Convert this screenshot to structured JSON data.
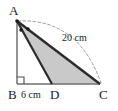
{
  "figure": {
    "type": "geometry-diagram",
    "width": 118,
    "height": 111,
    "colors": {
      "background": "#ffffff",
      "stroke": "#2b2b2b",
      "shade_fill": "#c9c9c9",
      "thin_stroke": "#6e6e6e",
      "dash_stroke": "#8c8c8c",
      "label_color": "#1a1a1a"
    },
    "vertices": [
      {
        "name": "A",
        "label": "A",
        "x": 17,
        "y": 21
      },
      {
        "name": "B",
        "label": "B",
        "x": 17,
        "y": 84
      },
      {
        "name": "D",
        "label": "D",
        "x": 52,
        "y": 84
      },
      {
        "name": "C",
        "label": "C",
        "x": 100,
        "y": 84
      }
    ],
    "segments": [
      {
        "name": "AB",
        "from": "A",
        "to": "B",
        "style": "solid-thin"
      },
      {
        "name": "BC",
        "from": "B",
        "to": "C",
        "style": "solid-thin"
      },
      {
        "name": "AD",
        "from": "A",
        "to": "D",
        "style": "solid-thick"
      },
      {
        "name": "AC",
        "from": "A",
        "to": "C",
        "style": "solid-thick"
      }
    ],
    "shaded_region": {
      "name": "triangle-ADC",
      "vertices": [
        "A",
        "D",
        "C"
      ],
      "fill": "#c9c9c9"
    },
    "right_angle": {
      "at": "B",
      "size": 7
    },
    "angle_marks": {
      "at": "A",
      "count": 2,
      "meaning": "equal-angles"
    },
    "arc": {
      "name": "measure-arc-AC",
      "from": "A",
      "to": "C",
      "style": "dashed"
    },
    "labels": {
      "vertex_a": "A",
      "vertex_b": "B",
      "vertex_c": "C",
      "vertex_d": "D",
      "base_measure": "6 cm",
      "hypotenuse_measure": "20 cm"
    }
  }
}
